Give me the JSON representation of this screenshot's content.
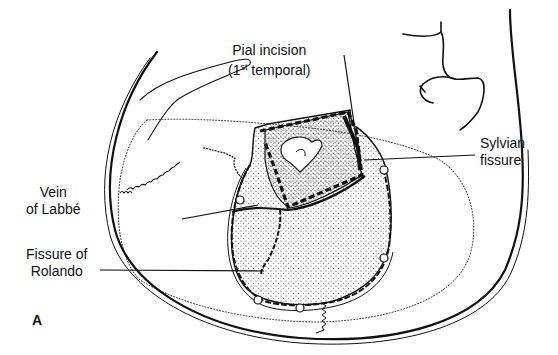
{
  "figure": {
    "panel_letter": "A",
    "labels": {
      "pial_incision": {
        "line1": "Pial incision",
        "line2_prefix": "(1",
        "line2_sup": "st",
        "line2_suffix": " temporal)"
      },
      "sylvian_fissure": {
        "line1": "Sylvian",
        "line2": "fissure"
      },
      "vein_of_labbe": {
        "line1": "Vein",
        "line2": "of Labbé"
      },
      "fissure_of_rolando": {
        "line1": "Fissure of",
        "line2": "Rolando"
      }
    },
    "colors": {
      "ink": "#111111",
      "paper": "#ffffff"
    }
  }
}
